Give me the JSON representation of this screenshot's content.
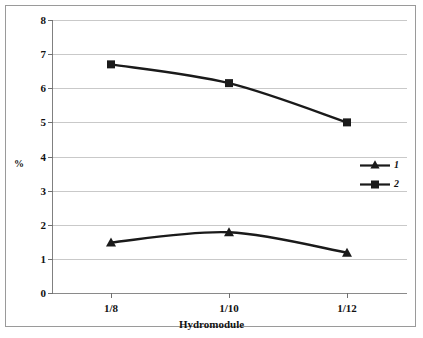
{
  "chart_data": {
    "type": "line",
    "title": "",
    "xlabel": "Hydromodule",
    "ylabel": "%",
    "categories": [
      "1/8",
      "1/10",
      "1/12"
    ],
    "series": [
      {
        "name": "1",
        "marker": "triangle",
        "values": [
          1.48,
          1.78,
          1.18
        ]
      },
      {
        "name": "2",
        "marker": "square",
        "values": [
          6.7,
          6.15,
          5.0
        ]
      }
    ],
    "ylim": [
      0,
      8
    ],
    "yticks": [
      0,
      1,
      2,
      3,
      4,
      5,
      6,
      7,
      8
    ],
    "ytick_labels": [
      "0",
      "1",
      "2",
      "3",
      "4",
      "5",
      "6",
      "7",
      "8"
    ],
    "grid": "horizontal",
    "legend_position": "right",
    "line_color": "#1a1a1a",
    "grid_color": "#c9c9c9",
    "background": "#ffffff"
  },
  "legend": {
    "items": [
      {
        "label": "1",
        "marker": "triangle-marker"
      },
      {
        "label": "2",
        "marker": "square-marker"
      }
    ]
  }
}
